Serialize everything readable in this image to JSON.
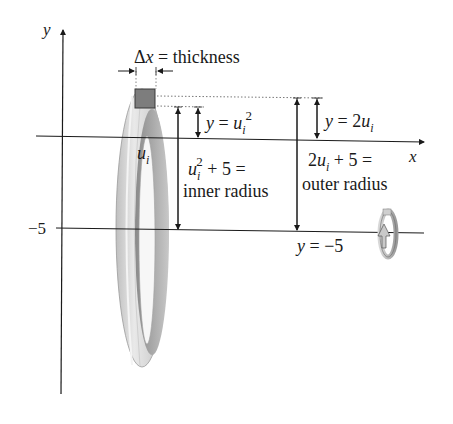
{
  "diagram": {
    "type": "washer-method-figure",
    "axes": {
      "y_label": "y",
      "x_label": "x",
      "tick_label_neg5": "−5"
    },
    "thickness_label": {
      "delta": "Δ",
      "var": "x",
      "rest": " = thickness"
    },
    "inner_height_label": {
      "lhs": "y",
      "eq": " = ",
      "var": "u",
      "sub": "i",
      "sup": "2"
    },
    "outer_height_label": {
      "lhs": "y",
      "eq": " = 2",
      "var": "u",
      "sub": "i"
    },
    "ui_label": {
      "var": "u",
      "sub": "i"
    },
    "inner_radius_label": {
      "var": "u",
      "sub": "i",
      "sup": "2",
      "rest": "  + 5 =",
      "line2": "inner radius"
    },
    "outer_radius_label": {
      "pre": "2",
      "var": "u",
      "sub": "i",
      "rest": " + 5 =",
      "line2": "outer radius"
    },
    "axis_of_rotation_label": {
      "lhs": "y",
      "rest": " = −5"
    },
    "icons": [
      "rotation-arrow-icon"
    ],
    "colors": {
      "line": "#1a1a1a",
      "ring_light": "#e6e6e6",
      "ring_mid": "#bdbdbd",
      "ring_dark": "#8f8f8f",
      "slice": "#7a7a7a"
    }
  }
}
